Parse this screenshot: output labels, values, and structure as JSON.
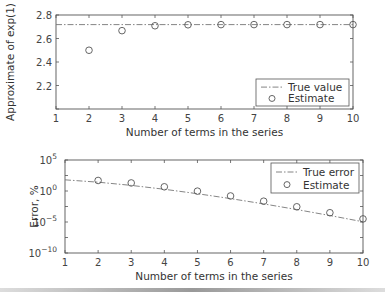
{
  "chart_data": [
    {
      "type": "line",
      "title": "",
      "xlabel": "Number of terms in the series",
      "ylabel": "Approximate of exp(1)",
      "xlim": [
        1,
        10
      ],
      "ylim": [
        2.0,
        2.8
      ],
      "xticks": [
        "1",
        "2",
        "3",
        "4",
        "5",
        "6",
        "7",
        "8",
        "9",
        "10"
      ],
      "yticks": [
        "2.2",
        "2.4",
        "2.6",
        "2.8"
      ],
      "grid": false,
      "legend_position": "lower right",
      "series": [
        {
          "name": "True value",
          "style": "dash-dot line",
          "x": [
            1,
            10
          ],
          "values": [
            2.71828,
            2.71828
          ]
        },
        {
          "name": "Estimate",
          "style": "circle markers",
          "x": [
            2,
            3,
            4,
            5,
            6,
            7,
            8,
            9,
            10
          ],
          "values": [
            2.5,
            2.6667,
            2.7083,
            2.7167,
            2.7181,
            2.7183,
            2.7183,
            2.7183,
            2.7183
          ]
        }
      ]
    },
    {
      "type": "line",
      "title": "",
      "xlabel": "Number of terms in the series",
      "ylabel": "Error, %",
      "xlim": [
        1,
        10
      ],
      "ylim": [
        "1e-10",
        "1e5"
      ],
      "yscale": "log",
      "xticks": [
        "1",
        "2",
        "3",
        "4",
        "5",
        "6",
        "7",
        "8",
        "9",
        "10"
      ],
      "yticks": [
        "10^-10",
        "10^-5",
        "10^0",
        "10^5"
      ],
      "grid": false,
      "legend_position": "upper right",
      "series": [
        {
          "name": "True error",
          "style": "dash-dot line",
          "x": [
            1,
            2,
            3,
            4,
            5,
            6,
            7,
            8,
            9,
            10
          ],
          "values": [
            63.2,
            26.4,
            8.03,
            1.9,
            0.366,
            0.0594,
            0.00832,
            0.00102,
            0.000111,
            1.09e-05
          ]
        },
        {
          "name": "Estimate",
          "style": "circle markers",
          "x": [
            2,
            3,
            4,
            5,
            6,
            7,
            8,
            9,
            10
          ],
          "values": [
            50,
            20,
            4.76,
            0.952,
            0.159,
            0.0227,
            0.00284,
            0.000315,
            3.15e-05
          ]
        }
      ]
    }
  ],
  "top": {
    "ylabel": "Approximate of exp(1)",
    "xlabel": "Number of terms in the series",
    "legend": [
      "True value",
      "Estimate"
    ]
  },
  "bottom": {
    "ylabel": "Error, %",
    "xlabel": "Number of terms in the series",
    "legend": [
      "True error",
      "Estimate"
    ]
  }
}
